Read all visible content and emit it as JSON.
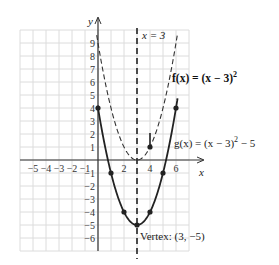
{
  "chart_data": {
    "type": "line",
    "title": "",
    "xlabel": "x",
    "ylabel": "y",
    "xlim": [
      -6,
      7
    ],
    "ylim": [
      -7,
      10
    ],
    "grid": true,
    "x_ticks": [
      -5,
      -4,
      -3,
      -2,
      -1,
      2,
      4,
      6
    ],
    "y_ticks": [
      9,
      8,
      7,
      6,
      5,
      4,
      3,
      2,
      1,
      -1,
      -2,
      -3,
      -4,
      -5,
      -6
    ],
    "series": [
      {
        "name": "f(x) = (x − 3)²",
        "style": "dashed",
        "equation": "(x-3)^2",
        "points": [
          [
            0,
            9
          ],
          [
            1,
            4
          ],
          [
            2,
            1
          ],
          [
            3,
            0
          ],
          [
            4,
            1
          ],
          [
            5,
            4
          ],
          [
            6,
            9
          ]
        ],
        "marked_points": [
          [
            4,
            1
          ]
        ]
      },
      {
        "name": "g(x) = (x − 3)² − 5",
        "style": "solid",
        "equation": "(x-3)^2-5",
        "points": [
          [
            0,
            4
          ],
          [
            1,
            -1
          ],
          [
            2,
            -4
          ],
          [
            3,
            -5
          ],
          [
            4,
            -4
          ],
          [
            5,
            -1
          ],
          [
            6,
            4
          ]
        ],
        "marked_points": [
          [
            0,
            4
          ],
          [
            1,
            -1
          ],
          [
            2,
            -4
          ],
          [
            3,
            -5
          ],
          [
            4,
            -4
          ],
          [
            5,
            -1
          ],
          [
            6,
            4
          ]
        ]
      }
    ],
    "annotations": [
      {
        "text": "x = 3",
        "type": "vertical-line",
        "x": 3
      },
      {
        "text": "Vertex: (3, −5)",
        "x": 3,
        "y": -5
      }
    ]
  },
  "labels": {
    "y_axis": "y",
    "x_axis": "x",
    "axis_of_symmetry": "x = 3",
    "f_label": "f(x) = (x − 3)",
    "f_exp": "2",
    "g_label": "g(x) = (x − 3)",
    "g_exp": "2",
    "g_tail": " − 5",
    "vertex": "Vertex: (3, −5)"
  }
}
